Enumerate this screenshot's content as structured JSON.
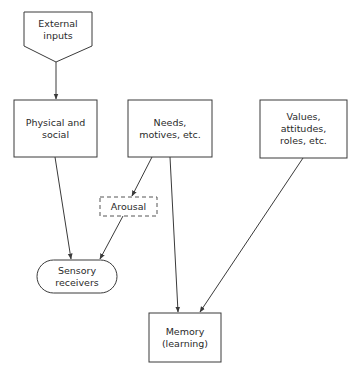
{
  "diagram": {
    "stroke_color": "#3a3a3a",
    "text_color": "#2a2a2a",
    "background": "#ffffff",
    "nodes": {
      "external_inputs": {
        "label": "External\ninputs",
        "shape": "pentagon-down"
      },
      "physical_social": {
        "label": "Physical and\nsocial",
        "shape": "rectangle"
      },
      "needs_motives": {
        "label": "Needs,\nmotives, etc.",
        "shape": "rectangle"
      },
      "values_attitudes": {
        "label": "Values,\nattitudes,\nroles, etc.",
        "shape": "rectangle"
      },
      "arousal": {
        "label": "Arousal",
        "shape": "dashed-rectangle"
      },
      "sensory_receivers": {
        "label": "Sensory\nreceivers",
        "shape": "stadium"
      },
      "memory": {
        "label": "Memory\n(learning)",
        "shape": "rectangle"
      }
    },
    "edges": [
      {
        "from": "External inputs",
        "to": "Physical and social"
      },
      {
        "from": "Physical and social",
        "to": "Sensory receivers"
      },
      {
        "from": "Needs, motives, etc.",
        "to": "Arousal"
      },
      {
        "from": "Arousal",
        "to": "Sensory receivers"
      },
      {
        "from": "Needs, motives, etc.",
        "to": "Memory (learning)"
      },
      {
        "from": "Values, attitudes, roles, etc.",
        "to": "Memory (learning)"
      }
    ]
  }
}
